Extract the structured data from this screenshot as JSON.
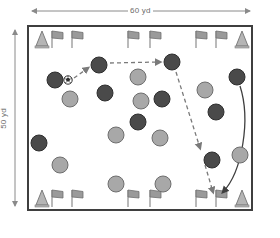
{
  "diagram": {
    "field": {
      "x": 28,
      "y": 26,
      "width": 224,
      "height": 184,
      "fill": "#ffffff",
      "stroke": "#3f3f3f",
      "stroke_width": 2
    },
    "dimensions": {
      "width_label": "60 yd",
      "height_label": "50 yd",
      "arrow_color": "#8a8a8a"
    },
    "colors": {
      "dark_player": "#4a4a4a",
      "light_player": "#a8a8a8",
      "player_stroke": "#2e2e2e",
      "cone": "#b5b5b5",
      "cone_stroke": "#7d7d7d",
      "flag": "#9a9a9a",
      "flag_stroke": "#6e6e6e",
      "flag_pole": "#8c8c8c",
      "dashed_path": "#7a7a7a",
      "solid_path": "#3f3f3f",
      "ball_fill": "#ffffff",
      "ball_stroke": "#2e2e2e"
    },
    "players": [
      {
        "id": "p1",
        "team": "dark",
        "cx": 55,
        "cy": 80,
        "r": 8
      },
      {
        "id": "p2",
        "team": "dark",
        "cx": 99,
        "cy": 65,
        "r": 8
      },
      {
        "id": "p3",
        "team": "dark",
        "cx": 172,
        "cy": 62,
        "r": 8
      },
      {
        "id": "p4",
        "team": "dark",
        "cx": 105,
        "cy": 93,
        "r": 8
      },
      {
        "id": "p5",
        "team": "dark",
        "cx": 162,
        "cy": 99,
        "r": 8
      },
      {
        "id": "p6",
        "team": "dark",
        "cx": 138,
        "cy": 122,
        "r": 8
      },
      {
        "id": "p7",
        "team": "dark",
        "cx": 39,
        "cy": 143,
        "r": 8
      },
      {
        "id": "p8",
        "team": "dark",
        "cx": 216,
        "cy": 112,
        "r": 8
      },
      {
        "id": "p9",
        "team": "dark",
        "cx": 212,
        "cy": 160,
        "r": 8
      },
      {
        "id": "p10",
        "team": "dark",
        "cx": 237,
        "cy": 77,
        "r": 8
      },
      {
        "id": "p11",
        "team": "light",
        "cx": 70,
        "cy": 99,
        "r": 8
      },
      {
        "id": "p12",
        "team": "light",
        "cx": 138,
        "cy": 77,
        "r": 8
      },
      {
        "id": "p13",
        "team": "light",
        "cx": 141,
        "cy": 101,
        "r": 8
      },
      {
        "id": "p14",
        "team": "light",
        "cx": 116,
        "cy": 135,
        "r": 8
      },
      {
        "id": "p15",
        "team": "light",
        "cx": 160,
        "cy": 138,
        "r": 8
      },
      {
        "id": "p16",
        "team": "light",
        "cx": 60,
        "cy": 165,
        "r": 8
      },
      {
        "id": "p17",
        "team": "light",
        "cx": 116,
        "cy": 184,
        "r": 8
      },
      {
        "id": "p18",
        "team": "light",
        "cx": 163,
        "cy": 184,
        "r": 8
      },
      {
        "id": "p19",
        "team": "light",
        "cx": 205,
        "cy": 90,
        "r": 8
      },
      {
        "id": "p20",
        "team": "light",
        "cx": 240,
        "cy": 155,
        "r": 8
      }
    ],
    "ball": {
      "cx": 68,
      "cy": 80,
      "r": 4
    },
    "paths": [
      {
        "id": "pass-1",
        "style": "dashed",
        "label": "pass from ball carrier to top player",
        "d": "M 74 78 L 88 68"
      },
      {
        "id": "pass-2",
        "style": "dashed",
        "label": "pass across to right top player",
        "d": "M 110 63 L 160 62"
      },
      {
        "id": "run-1",
        "style": "dashed",
        "label": "dashed run down the right side",
        "d": "M 176 72 L 200 148"
      },
      {
        "id": "run-2",
        "style": "dashed",
        "label": "dashed run continuing to corner",
        "d": "M 205 165 L 213 192"
      },
      {
        "id": "curve-1",
        "style": "solid",
        "label": "solid curved run from right player to bottom",
        "d": "M 240 86 C 249 120 240 170 222 192"
      }
    ],
    "cones": [
      {
        "id": "cone-tl",
        "x": 36,
        "y": 31
      },
      {
        "id": "cone-tr",
        "x": 236,
        "y": 31
      },
      {
        "id": "cone-bl",
        "x": 36,
        "y": 190
      },
      {
        "id": "cone-br",
        "x": 236,
        "y": 190
      }
    ],
    "flags": [
      {
        "id": "flag-t1",
        "x": 52,
        "y": 31
      },
      {
        "id": "flag-t2",
        "x": 72,
        "y": 31
      },
      {
        "id": "flag-t3",
        "x": 128,
        "y": 31
      },
      {
        "id": "flag-t4",
        "x": 150,
        "y": 31
      },
      {
        "id": "flag-t5",
        "x": 196,
        "y": 31
      },
      {
        "id": "flag-t6",
        "x": 216,
        "y": 31
      },
      {
        "id": "flag-b1",
        "x": 52,
        "y": 190
      },
      {
        "id": "flag-b2",
        "x": 72,
        "y": 190
      },
      {
        "id": "flag-b3",
        "x": 128,
        "y": 190
      },
      {
        "id": "flag-b4",
        "x": 150,
        "y": 190
      },
      {
        "id": "flag-b5",
        "x": 196,
        "y": 190
      },
      {
        "id": "flag-b6",
        "x": 216,
        "y": 190
      }
    ]
  }
}
